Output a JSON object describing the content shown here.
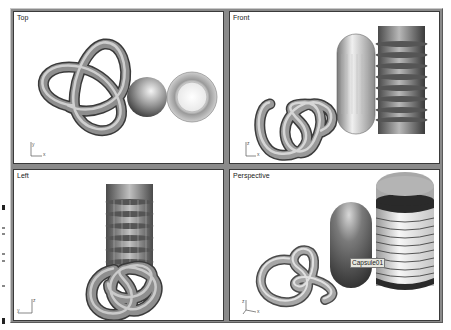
{
  "app": "3D modeling viewports (quad view)",
  "viewports": [
    {
      "id": "top",
      "label": "Top",
      "axes": [
        "y",
        "x"
      ]
    },
    {
      "id": "front",
      "label": "Front",
      "axes": [
        "z",
        "x"
      ]
    },
    {
      "id": "left",
      "label": "Left",
      "axes": [
        "z",
        "y"
      ]
    },
    {
      "id": "perspective",
      "label": "Perspective",
      "axes": [
        "z",
        "x",
        "y"
      ],
      "object_tooltip": "Capsule01"
    }
  ],
  "scene_objects": [
    "torus-knot",
    "capsule",
    "bellows-cylinder"
  ],
  "colors": {
    "frame": "#8a8a8a",
    "viewport_bg": "#ffffff",
    "viewport_border": "#3a3a3a"
  }
}
